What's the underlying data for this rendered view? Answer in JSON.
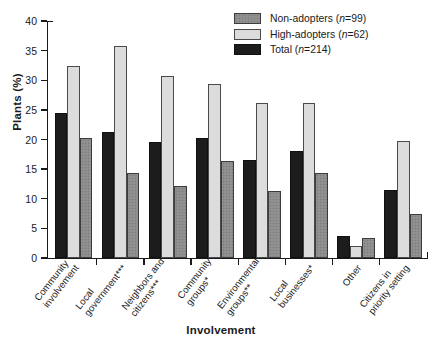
{
  "chart_data": {
    "type": "bar",
    "title": "",
    "xlabel": "Involvement",
    "ylabel": "Plants (%)",
    "ylim": [
      0,
      40
    ],
    "ytick_values": [
      0,
      5,
      10,
      15,
      20,
      25,
      30,
      35,
      40
    ],
    "ytick_labels": [
      "0",
      "5",
      "10",
      "15",
      "20",
      "25",
      "30",
      "35",
      "40"
    ],
    "grid": false,
    "legend_position": "top-right",
    "bar_order_in_group": [
      "Total",
      "High-adopters",
      "Non-adopters"
    ],
    "categories": [
      "Community involvement",
      "Local government***",
      "Neighbors and citizens***",
      "Community groups*",
      "Environmental groups**",
      "Local businesses*",
      "Other",
      "Citizens in priority setting"
    ],
    "category_lines": [
      [
        "Community",
        "involvement"
      ],
      [
        "Local",
        "government***"
      ],
      [
        "Neighbors and",
        "citizens***"
      ],
      [
        "Community",
        "groups*"
      ],
      [
        "Environmental",
        "groups**"
      ],
      [
        "Local",
        "businesses*"
      ],
      [
        "Other"
      ],
      [
        "Citizens in",
        "priority setting"
      ]
    ],
    "series": [
      {
        "name": "Non-adopters",
        "n": 99,
        "color": "#8d8d8d",
        "values": [
          20.3,
          14.3,
          12.2,
          16.4,
          11.3,
          14.4,
          3.4,
          7.5
        ]
      },
      {
        "name": "High-adopters",
        "n": 62,
        "color": "#dcdcdc",
        "values": [
          32.4,
          35.7,
          30.7,
          29.3,
          26.1,
          26.1,
          2.0,
          19.8
        ]
      },
      {
        "name": "Total",
        "n": 214,
        "color": "#1c1c1c",
        "values": [
          24.5,
          21.2,
          19.5,
          20.2,
          16.6,
          18.1,
          3.7,
          11.5
        ]
      }
    ]
  },
  "legend": {
    "entries": [
      {
        "label": "Non-adopters",
        "stat": "n",
        "equals": "=",
        "value": "99"
      },
      {
        "label": "High-adopters",
        "stat": "n",
        "equals": "=",
        "value": "62"
      },
      {
        "label": "Total",
        "stat": "n",
        "equals": "=",
        "value": "214"
      }
    ]
  },
  "axes": {
    "y_title": "Plants (%)",
    "x_title": "Involvement"
  }
}
